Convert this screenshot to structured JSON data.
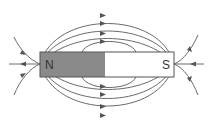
{
  "diagram": {
    "magnet": {
      "north_label": "N",
      "south_label": "S",
      "north_color": "#8a8a8a",
      "south_color": "#ffffff",
      "outline_color": "#555555"
    },
    "field_lines": {
      "color": "#555555",
      "arrow_direction": "north-to-south (outside magnet)",
      "top_count": 4,
      "bottom_count": 4,
      "pole_spokes_each_side": 3
    }
  }
}
